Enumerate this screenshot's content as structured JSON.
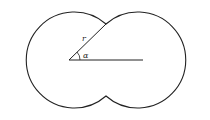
{
  "diagram": {
    "labels": {
      "radius": "r",
      "angle": "α"
    },
    "colors": {
      "stroke": "#222222",
      "background": "#ffffff"
    }
  }
}
